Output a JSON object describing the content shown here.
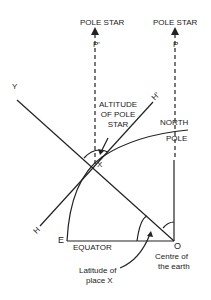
{
  "labels": {
    "pole_star_left": "POLE STAR",
    "pole_star_right": "POLE STAR",
    "p_prime": "P'",
    "p": "P",
    "y": "Y",
    "h_prime": "H'",
    "h": "H",
    "x": "X",
    "altitude_1": "ALTITUDE",
    "altitude_2": "OF POLE",
    "altitude_3": "STAR",
    "north": "NORTH",
    "pole": "POLE",
    "e": "E",
    "equator": "EQUATOR",
    "o": "O",
    "centre_1": "Centre of",
    "centre_2": "the earth",
    "latitude_1": "Latitude of",
    "latitude_2": "place X"
  }
}
